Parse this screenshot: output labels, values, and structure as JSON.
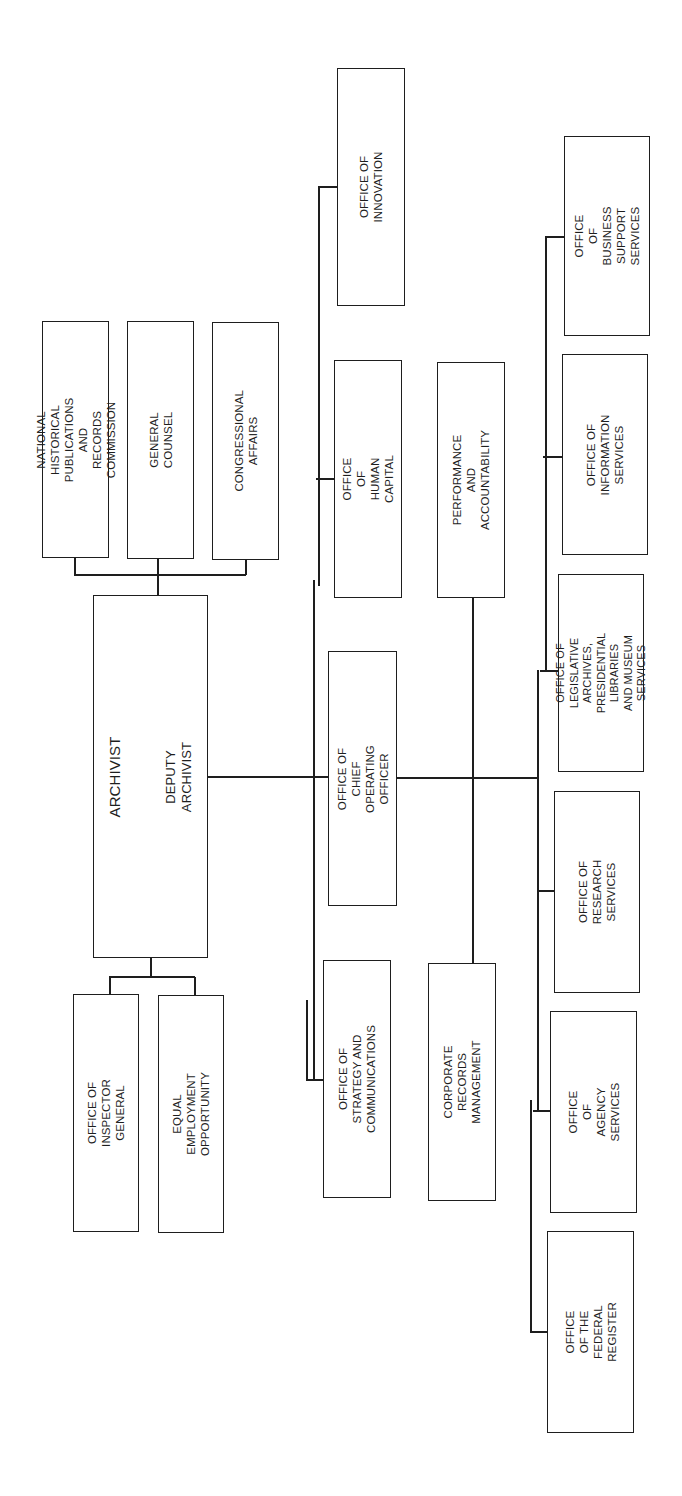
{
  "chart": {
    "title": "",
    "orientation": "rotated-90-ccw",
    "colors": {
      "line": "#1e1e1e",
      "background": "#ffffff"
    },
    "head": {
      "id": "archivist",
      "title": "ARCHIVIST",
      "subtitle": "DEPUTY ARCHIVIST"
    },
    "staff_top": [
      {
        "id": "nhprc",
        "label": "NATIONAL HISTORICAL\nPUBLICATIONS AND RECORDS\nCOMMISSION"
      },
      {
        "id": "general-counsel",
        "label": "GENERAL COUNSEL"
      },
      {
        "id": "congressional-affairs",
        "label": "CONGRESSIONAL AFFAIRS"
      }
    ],
    "staff_bottom": [
      {
        "id": "inspector-general",
        "label": "OFFICE OF\nINSPECTOR GENERAL"
      },
      {
        "id": "eeo",
        "label": "EQUAL EMPLOYMENT\nOPPORTUNITY"
      }
    ],
    "archivist_offices": [
      {
        "id": "innovation",
        "label": "OFFICE OF\nINNOVATION"
      },
      {
        "id": "human-capital",
        "label": "OFFICE OF\nHUMAN CAPITAL"
      },
      {
        "id": "coo",
        "label": "OFFICE OF CHIEF\nOPERATING OFFICER"
      },
      {
        "id": "strategy",
        "label": "OFFICE OF STRATEGY AND\nCOMMUNICATIONS"
      }
    ],
    "coo_staff": [
      {
        "id": "performance",
        "label": "PERFORMANCE AND\nACCOUNTABILITY"
      },
      {
        "id": "corporate-records",
        "label": "CORPORATE RECORDS\nMANAGEMENT"
      }
    ],
    "operating_offices": [
      {
        "id": "business-support",
        "label": "OFFICE OF BUSINESS\nSUPPORT SERVICES"
      },
      {
        "id": "information-services",
        "label": "OFFICE OF\nINFORMATION SERVICES"
      },
      {
        "id": "legislative-archives",
        "label": "OFFICE OF LEGISLATIVE\nARCHIVES, PRESIDENTIAL\nLIBRARIES AND MUSEUM\nSERVICES"
      },
      {
        "id": "research-services",
        "label": "OFFICE OF\nRESEARCH SERVICES"
      },
      {
        "id": "agency-services",
        "label": "OFFICE OF\nAGENCY SERVICES"
      },
      {
        "id": "federal-register",
        "label": "OFFICE OF THE\nFEDERAL REGISTER"
      }
    ]
  }
}
